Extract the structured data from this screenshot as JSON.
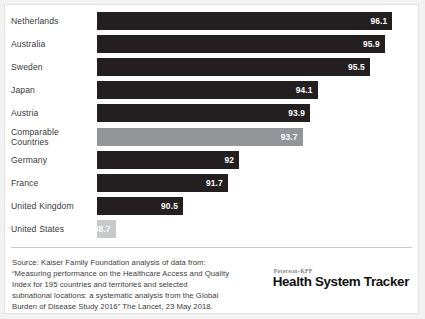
{
  "chart_data": {
    "type": "bar",
    "orientation": "horizontal",
    "title": "",
    "xlabel": "",
    "ylabel": "",
    "categories": [
      "Netherlands",
      "Australia",
      "Sweden",
      "Japan",
      "Austria",
      "Comparable Countries",
      "Germany",
      "France",
      "United Kingdom",
      "United States"
    ],
    "values": [
      96.1,
      95.9,
      95.5,
      94.1,
      93.9,
      93.7,
      92,
      91.7,
      90.5,
      88.7
    ],
    "value_labels": [
      "96.1",
      "95.9",
      "95.5",
      "94.1",
      "93.9",
      "93.7",
      "92",
      "91.7",
      "90.5",
      "88.7"
    ],
    "bar_styles": [
      "dark",
      "dark",
      "dark",
      "dark",
      "dark",
      "mid",
      "dark",
      "dark",
      "dark",
      "light"
    ],
    "colors": {
      "dark": "#231f20",
      "mid": "#939598",
      "light": "#c8c9cb",
      "value_text": "#ffffff",
      "label_text": "#3a3a3a"
    },
    "axis_baseline": 88.2,
    "axis_max": 96.6,
    "grid": false,
    "legend": false
  },
  "footer": {
    "source_lines": [
      "Source: Kaiser Family Foundation analysis of data from:",
      "“Measuring performance on the Healthcare Access and Quality",
      "Index for 195 countries and territories and selected",
      "subnational locations: a systematic analysis from the Global",
      "Burden of Disease Study 2016” The Lancet, 23 May 2018."
    ],
    "logo_eyebrow": "Peterson-KFF",
    "logo_title": "Health System Tracker"
  }
}
